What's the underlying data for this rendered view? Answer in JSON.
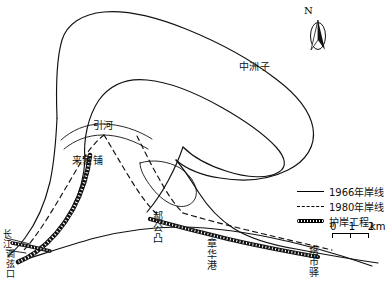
{
  "map": {
    "title": "",
    "labels": [
      {
        "name": "zhongzhouzi",
        "text": "中洲子",
        "x": 239,
        "y": 62,
        "vertical": false
      },
      {
        "name": "yinhe",
        "text": "引河",
        "x": 93,
        "y": 121,
        "vertical": false
      },
      {
        "name": "laijiapu",
        "text": "来家铺",
        "x": 72,
        "y": 156,
        "vertical": false
      },
      {
        "name": "haogongtu",
        "text": "郝公凸",
        "x": 151,
        "y": 211,
        "vertical": true
      },
      {
        "name": "zhanghuagang",
        "text": "章华港",
        "x": 205,
        "y": 238,
        "vertical": true
      },
      {
        "name": "tashiyi",
        "text": "塔市驿",
        "x": 307,
        "y": 245,
        "vertical": true
      },
      {
        "name": "changjiang",
        "text": "长江",
        "x": 2,
        "y": 231,
        "vertical": true
      },
      {
        "name": "tiaoxiankou",
        "text": "调弦口",
        "x": 5,
        "y": 248,
        "vertical": true
      }
    ],
    "compass": {
      "north_letter": "N"
    },
    "legend": {
      "entries": [
        {
          "key": "solid-line",
          "label": "1966年岸线"
        },
        {
          "key": "dashed-line",
          "label": "1980年岸线"
        },
        {
          "key": "revetment-band",
          "label": "护岸工程"
        }
      ]
    },
    "scale": {
      "ticks": [
        "0",
        "1",
        "2"
      ],
      "unit": "km"
    }
  },
  "colors": {
    "ink": "#000000",
    "paper": "#ffffff"
  }
}
